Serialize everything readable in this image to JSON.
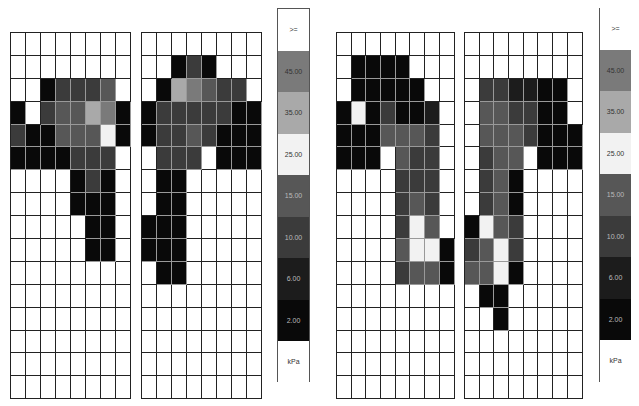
{
  "chart_data": {
    "type": "heatmap",
    "title": "",
    "unit": "kPa",
    "legend": {
      "title": "kPa",
      "bands": [
        {
          "label": ">=",
          "code": 8,
          "color": "#ffffff"
        },
        {
          "label": "45.00",
          "code": 7,
          "color": "#7a7a7a"
        },
        {
          "label": "35.00",
          "code": 6,
          "color": "#a9a9a9"
        },
        {
          "label": "25.00",
          "code": 5,
          "color": "#f2f2f2"
        },
        {
          "label": "15.00",
          "code": 4,
          "color": "#575757"
        },
        {
          "label": "10.00",
          "code": 3,
          "color": "#3b3b3b"
        },
        {
          "label": "6.00",
          "code": 2,
          "color": "#1c1c1c"
        },
        {
          "label": "2.00",
          "code": 1,
          "color": "#090909"
        },
        {
          "label": "",
          "code": 0,
          "color": "#ffffff"
        }
      ]
    },
    "cell_code_meaning": {
      "0": "below 2.00 kPa (no color)",
      "1": "2.00 band",
      "2": "6.00 band",
      "3": "10.00 band",
      "4": "15.00 band",
      "5": "25.00 band",
      "6": "35.00 band",
      "7": "45.00 band"
    },
    "panels": [
      {
        "name": "measurement-1",
        "feet": [
          {
            "side": "left",
            "rows": 16,
            "cols": 8,
            "values": [
              [
                0,
                0,
                0,
                0,
                0,
                0,
                0,
                0
              ],
              [
                0,
                0,
                0,
                0,
                0,
                0,
                0,
                0
              ],
              [
                0,
                0,
                1,
                3,
                3,
                3,
                4,
                0
              ],
              [
                1,
                0,
                3,
                4,
                4,
                6,
                7,
                1
              ],
              [
                3,
                1,
                1,
                4,
                4,
                4,
                5,
                1
              ],
              [
                1,
                1,
                1,
                1,
                3,
                3,
                3,
                0
              ],
              [
                0,
                0,
                0,
                0,
                1,
                3,
                1,
                0
              ],
              [
                0,
                0,
                0,
                0,
                1,
                1,
                1,
                0
              ],
              [
                0,
                0,
                0,
                0,
                0,
                1,
                1,
                0
              ],
              [
                0,
                0,
                0,
                0,
                0,
                1,
                1,
                0
              ],
              [
                0,
                0,
                0,
                0,
                0,
                0,
                0,
                0
              ],
              [
                0,
                0,
                0,
                0,
                0,
                0,
                0,
                0
              ],
              [
                0,
                0,
                0,
                0,
                0,
                0,
                0,
                0
              ],
              [
                0,
                0,
                0,
                0,
                0,
                0,
                0,
                0
              ],
              [
                0,
                0,
                0,
                0,
                0,
                0,
                0,
                0
              ],
              [
                0,
                0,
                0,
                0,
                0,
                0,
                0,
                0
              ]
            ]
          },
          {
            "side": "right",
            "rows": 16,
            "cols": 8,
            "values": [
              [
                0,
                0,
                0,
                0,
                0,
                0,
                0,
                0
              ],
              [
                0,
                0,
                1,
                3,
                1,
                0,
                0,
                0
              ],
              [
                0,
                1,
                6,
                7,
                4,
                3,
                3,
                0
              ],
              [
                1,
                3,
                3,
                3,
                3,
                3,
                1,
                1
              ],
              [
                1,
                3,
                3,
                4,
                3,
                1,
                1,
                1
              ],
              [
                0,
                3,
                3,
                3,
                0,
                1,
                1,
                1
              ],
              [
                0,
                1,
                1,
                0,
                0,
                0,
                0,
                0
              ],
              [
                0,
                1,
                1,
                0,
                0,
                0,
                0,
                0
              ],
              [
                1,
                1,
                1,
                0,
                0,
                0,
                0,
                0
              ],
              [
                1,
                1,
                1,
                0,
                0,
                0,
                0,
                0
              ],
              [
                0,
                1,
                1,
                0,
                0,
                0,
                0,
                0
              ],
              [
                0,
                0,
                0,
                0,
                0,
                0,
                0,
                0
              ],
              [
                0,
                0,
                0,
                0,
                0,
                0,
                0,
                0
              ],
              [
                0,
                0,
                0,
                0,
                0,
                0,
                0,
                0
              ],
              [
                0,
                0,
                0,
                0,
                0,
                0,
                0,
                0
              ],
              [
                0,
                0,
                0,
                0,
                0,
                0,
                0,
                0
              ]
            ]
          }
        ]
      },
      {
        "name": "measurement-2",
        "feet": [
          {
            "side": "left",
            "rows": 16,
            "cols": 8,
            "values": [
              [
                0,
                0,
                0,
                0,
                0,
                0,
                0,
                0
              ],
              [
                0,
                1,
                1,
                1,
                1,
                0,
                0,
                0
              ],
              [
                0,
                1,
                1,
                1,
                1,
                1,
                0,
                0
              ],
              [
                1,
                5,
                1,
                3,
                1,
                1,
                2,
                0
              ],
              [
                1,
                1,
                1,
                4,
                4,
                4,
                3,
                0
              ],
              [
                1,
                1,
                1,
                0,
                4,
                3,
                3,
                0
              ],
              [
                0,
                0,
                0,
                0,
                3,
                3,
                3,
                0
              ],
              [
                0,
                0,
                0,
                0,
                3,
                4,
                3,
                0
              ],
              [
                0,
                0,
                0,
                0,
                3,
                5,
                4,
                0
              ],
              [
                0,
                0,
                0,
                0,
                4,
                5,
                5,
                1
              ],
              [
                0,
                0,
                0,
                0,
                3,
                4,
                4,
                1
              ],
              [
                0,
                0,
                0,
                0,
                0,
                0,
                0,
                0
              ],
              [
                0,
                0,
                0,
                0,
                0,
                0,
                0,
                0
              ],
              [
                0,
                0,
                0,
                0,
                0,
                0,
                0,
                0
              ],
              [
                0,
                0,
                0,
                0,
                0,
                0,
                0,
                0
              ],
              [
                0,
                0,
                0,
                0,
                0,
                0,
                0,
                0
              ]
            ]
          },
          {
            "side": "right",
            "rows": 16,
            "cols": 8,
            "values": [
              [
                0,
                0,
                0,
                0,
                0,
                0,
                0,
                0
              ],
              [
                0,
                0,
                0,
                0,
                0,
                0,
                0,
                0
              ],
              [
                0,
                3,
                3,
                2,
                2,
                1,
                1,
                0
              ],
              [
                0,
                4,
                4,
                3,
                3,
                1,
                1,
                0
              ],
              [
                0,
                4,
                4,
                4,
                3,
                1,
                1,
                1
              ],
              [
                0,
                3,
                4,
                4,
                0,
                1,
                1,
                1
              ],
              [
                0,
                3,
                4,
                1,
                0,
                0,
                0,
                0
              ],
              [
                0,
                3,
                4,
                1,
                0,
                0,
                0,
                0
              ],
              [
                1,
                5,
                4,
                3,
                0,
                0,
                0,
                0
              ],
              [
                3,
                4,
                5,
                3,
                0,
                0,
                0,
                0
              ],
              [
                4,
                4,
                5,
                1,
                0,
                0,
                0,
                0
              ],
              [
                0,
                1,
                1,
                0,
                0,
                0,
                0,
                0
              ],
              [
                0,
                0,
                1,
                0,
                0,
                0,
                0,
                0
              ],
              [
                0,
                0,
                0,
                0,
                0,
                0,
                0,
                0
              ],
              [
                0,
                0,
                0,
                0,
                0,
                0,
                0,
                0
              ],
              [
                0,
                0,
                0,
                0,
                0,
                0,
                0,
                0
              ]
            ]
          }
        ]
      }
    ]
  },
  "layout": {
    "panels": [
      {
        "grids": [
          {
            "left": 10,
            "top": 32,
            "cellW": 15,
            "cellH": 22.9
          },
          {
            "left": 141,
            "top": 32,
            "cellW": 15,
            "cellH": 22.9
          }
        ],
        "legend": {
          "left": 277,
          "top": 8,
          "width": 33,
          "bandH": 41.5,
          "boxed": true
        }
      },
      {
        "grids": [
          {
            "left": 336,
            "top": 32,
            "cellW": 14.7,
            "cellH": 22.9
          },
          {
            "left": 464,
            "top": 32,
            "cellW": 14.7,
            "cellH": 22.9
          }
        ],
        "legend": {
          "left": 600,
          "top": 8,
          "width": 31,
          "bandH": 41.5,
          "boxed": false
        }
      }
    ]
  }
}
